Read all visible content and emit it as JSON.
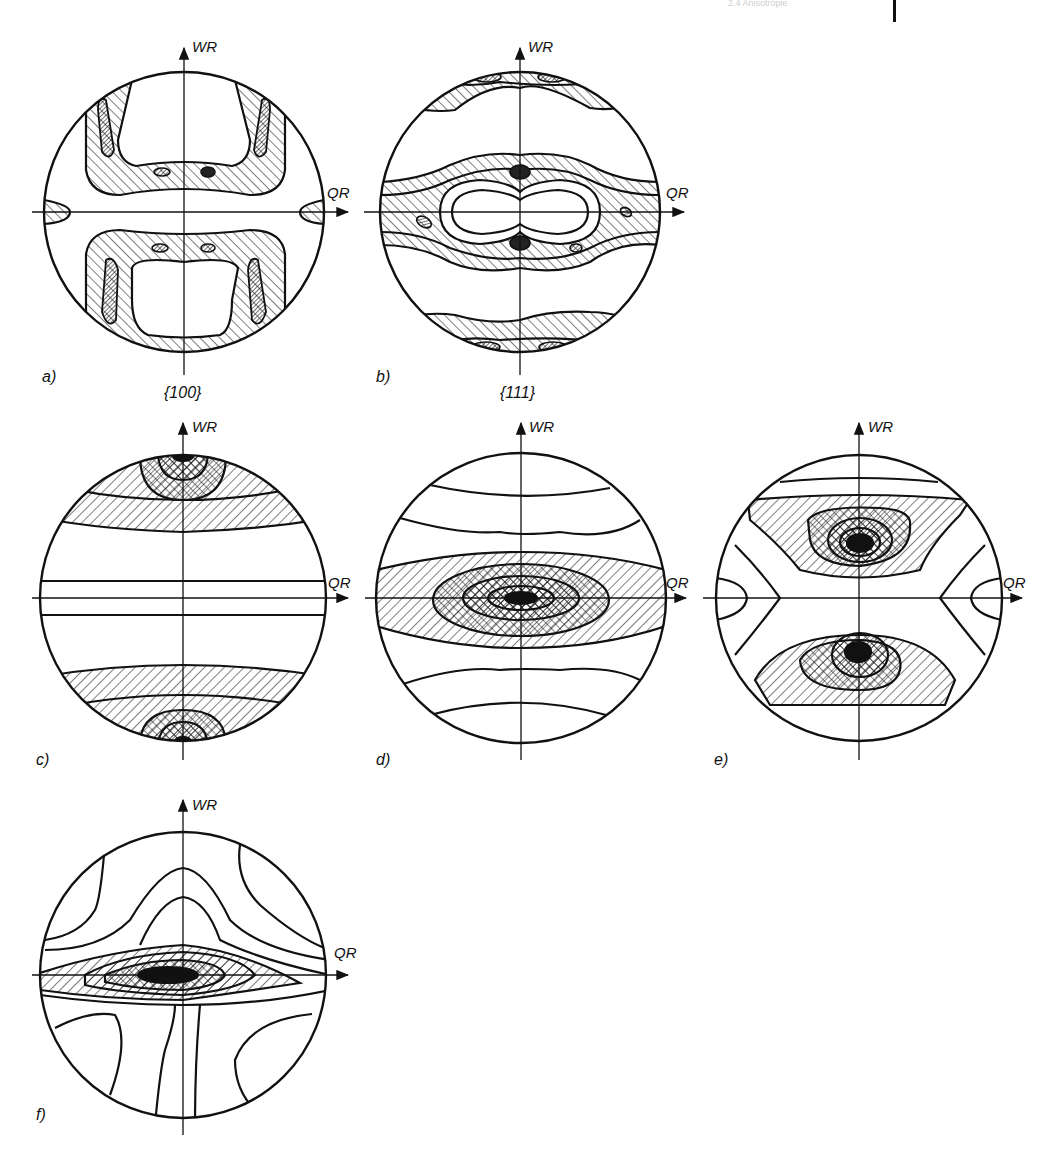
{
  "page": {
    "running_header": "2.4 Anisotropie",
    "background": "#ffffff",
    "ink": "#111111"
  },
  "axes": {
    "vertical_label": "WR",
    "horizontal_label": "QR"
  },
  "panels": [
    {
      "id": "a",
      "label": "a)",
      "caption": "{100}",
      "description": "{100} pole figure: two U-shaped hatched bands above and below QR with dense maxima at sides"
    },
    {
      "id": "b",
      "label": "b)",
      "caption": "{111}",
      "description": "{111} pole figure: central peanut-shaped hatched ring along QR, rim bands top and bottom"
    },
    {
      "id": "c",
      "label": "c)",
      "caption": "",
      "description": "Horizontal bands; cross-hatched maxima at WR poles"
    },
    {
      "id": "d",
      "label": "d)",
      "caption": "",
      "description": "Horizontal bands; concentric elliptical maximum at centre along QR"
    },
    {
      "id": "e",
      "label": "e)",
      "caption": "",
      "description": "Two cross-hatched maxima above and below centre, hyperbolic contours at QR sides"
    },
    {
      "id": "f",
      "label": "f)",
      "caption": "",
      "description": "Lens-shaped maximum along QR with solid core; wavy contours above and below"
    }
  ],
  "legend": {
    "hatch_single": "medium intensity",
    "hatch_cross": "high intensity",
    "solid": "maximum intensity"
  }
}
